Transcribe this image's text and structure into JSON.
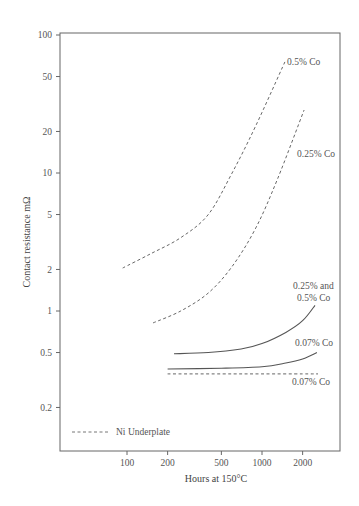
{
  "chart_data": {
    "type": "line",
    "title": "",
    "xlabel": "Hours at 150°C",
    "ylabel": "Contact resistance mΩ",
    "xscale": "log",
    "yscale": "log",
    "xlim": [
      35,
      5000
    ],
    "ylim": [
      0.1,
      100
    ],
    "xticks": [
      100,
      200,
      500,
      1000,
      2000
    ],
    "xtick_labels": [
      "100",
      "200",
      "500",
      "1000",
      "2000"
    ],
    "yticks": [
      100,
      50,
      20,
      10,
      5,
      2,
      1,
      0.5,
      0.2
    ],
    "ytick_labels": [
      "100",
      "50",
      "20",
      "10",
      "5",
      "2",
      "1",
      "0.5",
      "0.2"
    ],
    "grid": false,
    "legend": [
      {
        "label": "Ni Underplate",
        "style": "dashed"
      }
    ],
    "legend_position": "lower left",
    "series": [
      {
        "name": "0.5% Co",
        "style": "dashed",
        "x": [
          93,
          150,
          250,
          400,
          600,
          900,
          1480
        ],
        "y": [
          2.05,
          2.6,
          3.4,
          5.0,
          10,
          22,
          64
        ]
      },
      {
        "name": "0.25% Co",
        "style": "dashed",
        "x": [
          156,
          250,
          400,
          600,
          900,
          1300,
          2050
        ],
        "y": [
          0.82,
          1.0,
          1.35,
          2.1,
          4.0,
          9.0,
          28.6
        ]
      },
      {
        "name": "0.25% and 0.5% Co",
        "style": "solid",
        "x": [
          223,
          400,
          700,
          1000,
          1500,
          2000,
          2470
        ],
        "y": [
          0.49,
          0.5,
          0.53,
          0.58,
          0.7,
          0.85,
          1.1
        ]
      },
      {
        "name": "0.07% Co",
        "style": "solid",
        "x": [
          200,
          500,
          1000,
          1500,
          2000,
          2550
        ],
        "y": [
          0.38,
          0.385,
          0.395,
          0.42,
          0.45,
          0.5
        ]
      },
      {
        "name": "0.07% Co",
        "style": "dashed",
        "x": [
          200,
          500,
          1000,
          2000,
          2600
        ],
        "y": [
          0.35,
          0.35,
          0.35,
          0.35,
          0.35
        ]
      }
    ],
    "annotations": [
      "0.5% Co",
      "0.25% Co",
      "0.25% and",
      "0.5% Co",
      "0.07% Co",
      "0.07% Co"
    ]
  },
  "labels": {
    "xlabel": "Hours at 150°C",
    "ylabel": "Contact resistance mΩ",
    "legend": "Ni Underplate",
    "anno_05": "0.5% Co",
    "anno_025": "0.25% Co",
    "anno_both_1": "0.25% and",
    "anno_both_2": "0.5% Co",
    "anno_007_solid": "0.07% Co",
    "anno_007_dashed": "0.07% Co"
  }
}
